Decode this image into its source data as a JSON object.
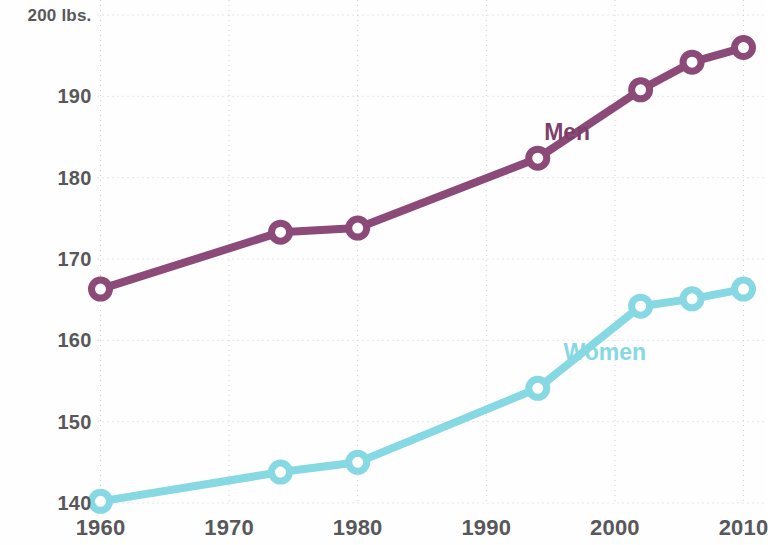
{
  "chart_data": {
    "type": "line",
    "title": "",
    "subtitle": "",
    "xlabel": "",
    "ylabel": "",
    "unit_label": "200 lbs.",
    "xlim": [
      1958,
      2012
    ],
    "ylim": [
      139,
      200
    ],
    "grid": true,
    "grid_style": "dotted",
    "legend": "inline-series-labels",
    "y_ticks": [
      "200 lbs.",
      "190",
      "180",
      "170",
      "160",
      "150",
      "140"
    ],
    "y_tick_values": [
      200,
      190,
      180,
      170,
      160,
      150,
      140
    ],
    "x_ticks": [
      "1960",
      "1970",
      "1980",
      "1990",
      "2000",
      "2010"
    ],
    "x_tick_values": [
      1960,
      1970,
      1980,
      1990,
      2000,
      2010
    ],
    "series": [
      {
        "name": "Men",
        "color": "#8b4a77",
        "x": [
          1960,
          1974,
          1980,
          1994,
          2002,
          2006,
          2010
        ],
        "values": [
          166.3,
          173.3,
          173.8,
          182.4,
          190.8,
          194.2,
          196.0
        ]
      },
      {
        "name": "Women",
        "color": "#86d8e2",
        "x": [
          1960,
          1974,
          1980,
          1994,
          2002,
          2006,
          2010
        ],
        "values": [
          140.2,
          143.8,
          145.0,
          154.1,
          164.2,
          165.1,
          166.3
        ]
      }
    ],
    "annotations": [
      {
        "text": "Men",
        "x": 1994.5,
        "y": 185.5,
        "color": "#7d3f6b"
      },
      {
        "text": "Women",
        "x": 1996.0,
        "y": 158.5,
        "color": "#86d8e2"
      }
    ]
  },
  "axis": {
    "y_labels": [
      "200 lbs.",
      "190",
      "180",
      "170",
      "160",
      "150",
      "140"
    ],
    "x_labels": [
      "1960",
      "1970",
      "1980",
      "1990",
      "2000",
      "2010"
    ]
  },
  "labels": {
    "men": "Men",
    "women": "Women"
  },
  "colors": {
    "men": "#8b4a77",
    "men_text": "#7d3f6b",
    "women": "#86d8e2",
    "grid": "#cfcfd4",
    "tick_text": "#58585b",
    "background": "#fefefe"
  }
}
